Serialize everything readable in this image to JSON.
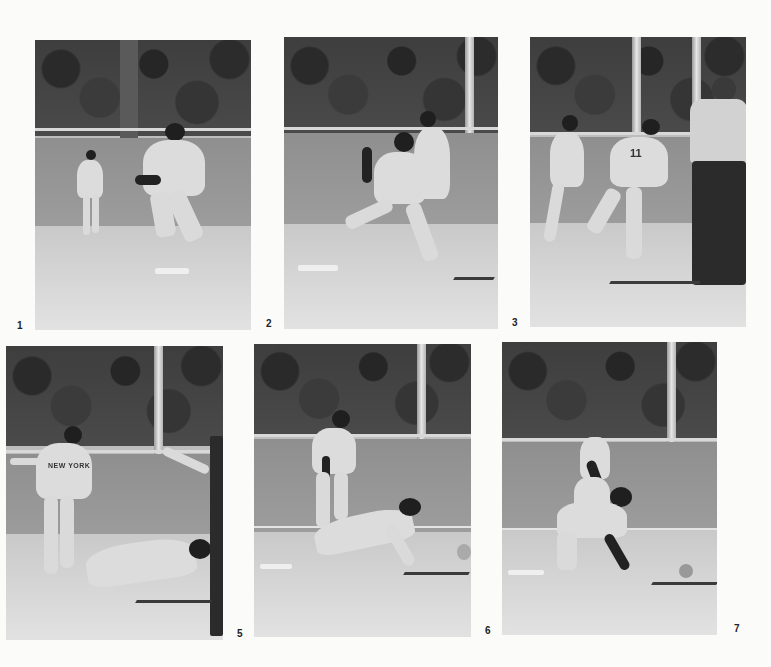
{
  "page": {
    "background": "#fbfbfa"
  },
  "photos": [
    {
      "number": "1",
      "scene": "shortstop fields ball near second base, infielder in background"
    },
    {
      "number": "2",
      "scene": "shortstop throws across body while second baseman covers the bag"
    },
    {
      "number": "3",
      "scene": "fielder #11 spins after throw, umpire watching at right"
    },
    {
      "number": "5",
      "scene": "runner slides head-first into second; fielder in 'NEW YORK' uniform stands over bag"
    },
    {
      "number": "6",
      "scene": "runner dives toward base, fielder stands behind"
    },
    {
      "number": "7",
      "scene": "runner on hands and knees at base, ball rolling away"
    }
  ],
  "labels": {
    "p1": "1",
    "p2": "2",
    "p3": "3",
    "p4": "5",
    "p5": "6",
    "p6": "7"
  },
  "jersey_text": {
    "p4": "NEW YORK",
    "p3": "11"
  }
}
